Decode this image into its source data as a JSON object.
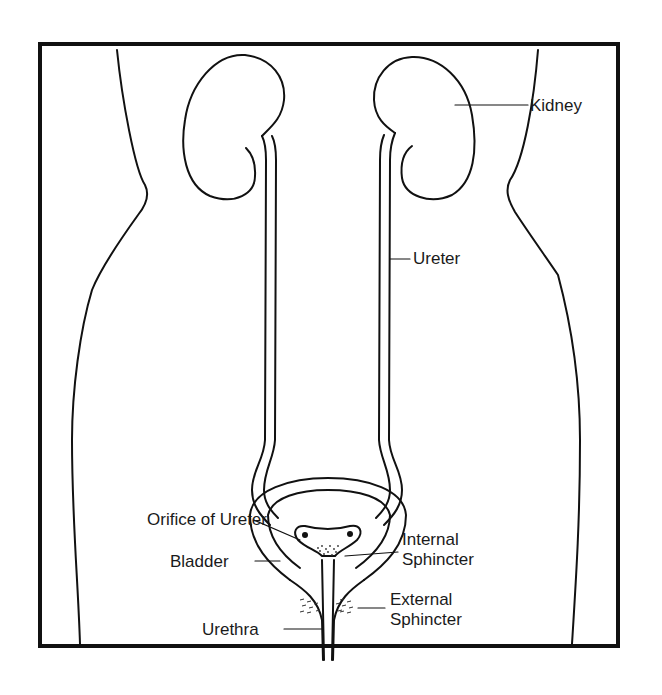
{
  "diagram": {
    "colors": {
      "line": "#111111",
      "background": "#ffffff",
      "text": "#1a1a1a"
    },
    "labels": {
      "kidney": "Kidney",
      "ureter": "Ureter",
      "orifice_of_ureter": "Orifice of Ureter",
      "bladder": "Bladder",
      "urethra": "Urethra",
      "internal_sphincter_line1": "Internal",
      "internal_sphincter_line2": "Sphincter",
      "external_sphincter_line1": "External",
      "external_sphincter_line2": "Sphincter"
    }
  }
}
